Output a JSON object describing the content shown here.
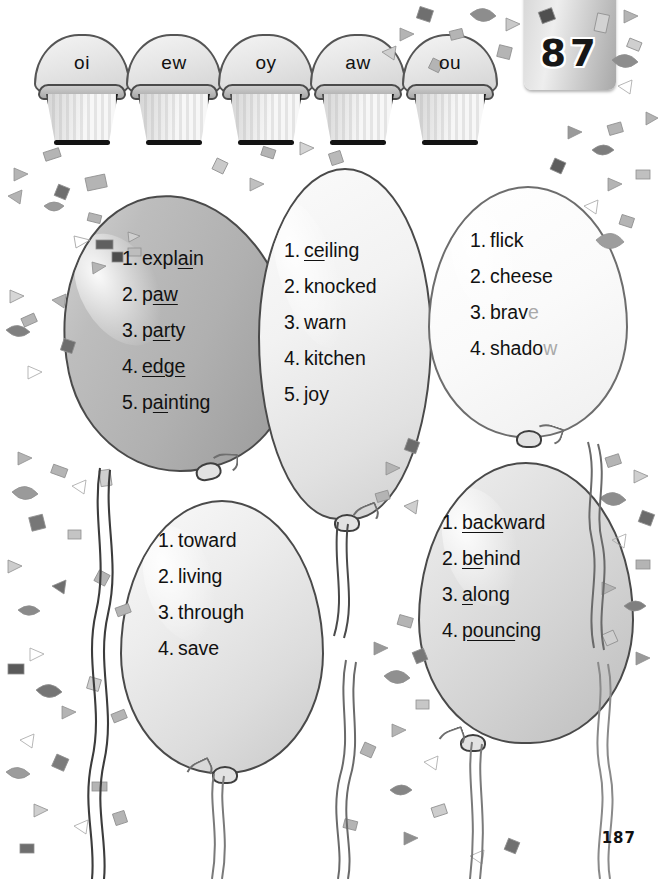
{
  "page": {
    "tab_number": "87",
    "footer_number": "187"
  },
  "cupcakes": [
    {
      "label": "oi"
    },
    {
      "label": "ew"
    },
    {
      "label": "oy"
    },
    {
      "label": "aw"
    },
    {
      "label": "ou"
    }
  ],
  "balloons": [
    {
      "id": "balloon-1",
      "color": "#b0b0b0",
      "items": [
        {
          "num": "1.",
          "pre": "expl",
          "underline": "ai",
          "post": "n"
        },
        {
          "num": "2.",
          "pre": "p",
          "underline": "aw",
          "post": ""
        },
        {
          "num": "3.",
          "pre": "p",
          "underline": "ar",
          "post": "ty"
        },
        {
          "num": "4.",
          "pre": "",
          "underline": "edge",
          "post": ""
        },
        {
          "num": "5.",
          "pre": "p",
          "underline": "ai",
          "post": "nting"
        }
      ]
    },
    {
      "id": "balloon-2",
      "color": "#e1e1e1",
      "items": [
        {
          "num": "1.",
          "pre": "",
          "underline": "ce",
          "post": "iling"
        },
        {
          "num": "2.",
          "pre": "knocked",
          "underline": "",
          "post": ""
        },
        {
          "num": "3.",
          "pre": "warn",
          "underline": "",
          "post": ""
        },
        {
          "num": "4.",
          "pre": "kitchen",
          "underline": "",
          "post": ""
        },
        {
          "num": "5.",
          "pre": "joy",
          "underline": "",
          "post": ""
        }
      ]
    },
    {
      "id": "balloon-3",
      "color": "#fafafa",
      "items": [
        {
          "num": "1.",
          "pre": "flick",
          "underline": "",
          "post": ""
        },
        {
          "num": "2.",
          "pre": "cheese",
          "underline": "",
          "post": ""
        },
        {
          "num": "3.",
          "pre": "brav",
          "underline": "",
          "post": "",
          "faded": "e"
        },
        {
          "num": "4.",
          "pre": "shado",
          "underline": "",
          "post": "",
          "faded": "w"
        }
      ]
    },
    {
      "id": "balloon-4",
      "color": "#dcdcdc",
      "items": [
        {
          "num": "1.",
          "pre": "toward",
          "underline": "",
          "post": ""
        },
        {
          "num": "2.",
          "pre": "living",
          "underline": "",
          "post": ""
        },
        {
          "num": "3.",
          "pre": "through",
          "underline": "",
          "post": ""
        },
        {
          "num": "4.",
          "pre": "save",
          "underline": "",
          "post": ""
        }
      ]
    },
    {
      "id": "balloon-5",
      "color": "#d2d2d2",
      "items": [
        {
          "num": "1.",
          "pre": "",
          "underline": "back",
          "post": "ward"
        },
        {
          "num": "2.",
          "pre": "",
          "underline": "be",
          "post": "hind"
        },
        {
          "num": "3.",
          "pre": "",
          "underline": "a",
          "post": "long"
        },
        {
          "num": "4.",
          "pre": "",
          "underline": "pounc",
          "post": "ing"
        }
      ]
    }
  ]
}
